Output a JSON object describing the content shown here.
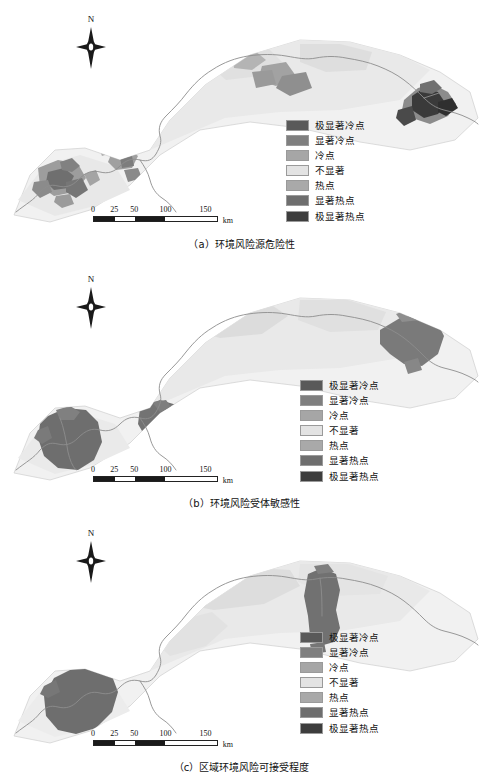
{
  "figure": {
    "type": "choropleth-map-series",
    "panels": [
      {
        "id": "a",
        "caption": "（a）环境风险源危险性",
        "north_label": "N",
        "north_icon": "north-arrow-icon",
        "scalebar": {
          "ticks": [
            "0",
            "25",
            "50",
            "100",
            "150"
          ],
          "unit": "km",
          "tick_positions_pct": [
            0,
            17,
            33,
            58,
            90
          ]
        },
        "legend": {
          "items": [
            {
              "label": "极显著冷点",
              "color": "#595959"
            },
            {
              "label": "显著冷点",
              "color": "#7f7f7f"
            },
            {
              "label": "冷点",
              "color": "#a6a6a6"
            },
            {
              "label": "不显著",
              "color": "#e3e3e3"
            },
            {
              "label": "热点",
              "color": "#a9a9a9"
            },
            {
              "label": "显著热点",
              "color": "#6e6e6e"
            },
            {
              "label": "极显著热点",
              "color": "#3d3d3d"
            }
          ]
        }
      },
      {
        "id": "b",
        "caption": "（b）环境风险受体敏感性",
        "north_label": "N",
        "north_icon": "north-arrow-icon",
        "scalebar": {
          "ticks": [
            "0",
            "25",
            "50",
            "100",
            "150"
          ],
          "unit": "km",
          "tick_positions_pct": [
            0,
            17,
            33,
            58,
            90
          ]
        },
        "legend": {
          "items": [
            {
              "label": "极显著冷点",
              "color": "#595959"
            },
            {
              "label": "显著冷点",
              "color": "#7f7f7f"
            },
            {
              "label": "冷点",
              "color": "#a6a6a6"
            },
            {
              "label": "不显著",
              "color": "#e3e3e3"
            },
            {
              "label": "热点",
              "color": "#a9a9a9"
            },
            {
              "label": "显著热点",
              "color": "#6e6e6e"
            },
            {
              "label": "极显著热点",
              "color": "#3d3d3d"
            }
          ]
        }
      },
      {
        "id": "c",
        "caption": "（c）区域环境风险可接受程度",
        "north_label": "N",
        "north_icon": "north-arrow-icon",
        "scalebar": {
          "ticks": [
            "0",
            "25",
            "50",
            "100",
            "150"
          ],
          "unit": "km",
          "tick_positions_pct": [
            0,
            17,
            33,
            58,
            90
          ]
        },
        "legend": {
          "items": [
            {
              "label": "极显著冷点",
              "color": "#595959"
            },
            {
              "label": "显著冷点",
              "color": "#7f7f7f"
            },
            {
              "label": "冷点",
              "color": "#a6a6a6"
            },
            {
              "label": "不显著",
              "color": "#e3e3e3"
            },
            {
              "label": "热点",
              "color": "#a9a9a9"
            },
            {
              "label": "显著热点",
              "color": "#6e6e6e"
            },
            {
              "label": "极显著热点",
              "color": "#3d3d3d"
            }
          ]
        }
      }
    ],
    "palette": {
      "background": "#ffffff",
      "base_fill": "#f0f0f0",
      "base_fill_mid": "#e6e6e6",
      "outline": "#b8b8b8",
      "river": "#8d8d8d"
    }
  }
}
